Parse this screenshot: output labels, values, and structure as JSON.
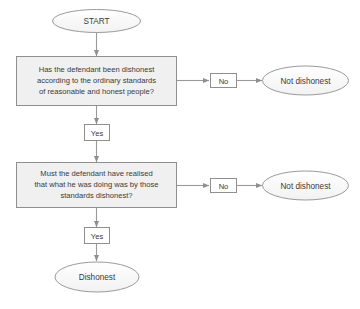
{
  "diagram": {
    "colors": {
      "shape_fill": "#f0f0f0",
      "shape_stroke": "#9a9a9a",
      "ellipse_fill": "#fafafa",
      "text": "#3a3a3a",
      "connector": "#9a9a9a",
      "background": "#ffffff"
    },
    "nodes": {
      "start": {
        "type": "terminator",
        "label": "START"
      },
      "question_one": {
        "type": "process",
        "line1": "Has the defendant been dishonest",
        "line2": "according to the ordinary standards",
        "line3": "of reasonable and honest people?"
      },
      "question_two": {
        "type": "process",
        "line1": "Must the defendant have realised",
        "line2": "that what he was doing was by those",
        "line3": "standards dishonest?"
      },
      "not_dishonest_one": {
        "type": "terminator",
        "label": "Not dishonest"
      },
      "not_dishonest_two": {
        "type": "terminator",
        "label": "Not dishonest"
      },
      "dishonest": {
        "type": "terminator",
        "label": "Dishonest"
      }
    },
    "edge_labels": {
      "no_one": "No",
      "no_two": "No",
      "yes_one": "Yes",
      "yes_two": "Yes"
    }
  }
}
